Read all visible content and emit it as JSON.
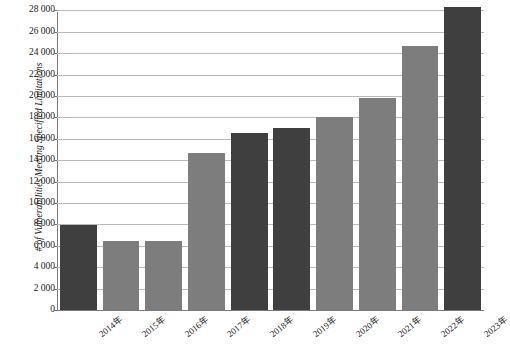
{
  "chart_data": {
    "type": "bar",
    "title": "",
    "subtitle": "",
    "xlabel": "",
    "ylabel": "# of Vulnerabilities Meeting Specified Limitations",
    "categories": [
      "2014年",
      "2015年",
      "2016年",
      "2017年",
      "2018年",
      "2019年",
      "2020年",
      "2021年",
      "2022年",
      "2023年"
    ],
    "values": [
      7900,
      6450,
      6450,
      14700,
      16500,
      17000,
      18000,
      19800,
      24700,
      28300
    ],
    "series": [
      {
        "name": "# of Vulnerabilities Meeting Specified Limitations",
        "values": [
          7900,
          6450,
          6450,
          14700,
          16500,
          17000,
          18000,
          19800,
          24700,
          28300
        ]
      }
    ],
    "bar_colors": [
      "#3f3f3f",
      "#7d7d7d",
      "#7d7d7d",
      "#7d7d7d",
      "#3f3f3f",
      "#3f3f3f",
      "#7d7d7d",
      "#7d7d7d",
      "#7d7d7d",
      "#3f3f3f"
    ],
    "ylim": [
      0,
      29000
    ],
    "ytick_values": [
      0,
      2000,
      4000,
      6000,
      8000,
      10000,
      12000,
      14000,
      16000,
      18000,
      20000,
      22000,
      24000,
      26000,
      28000
    ],
    "ytick_labels": [
      "0",
      "2 000",
      "4 000",
      "6 000",
      "8 000",
      "10 000",
      "12 000",
      "14 000",
      "16 000",
      "18 000",
      "20 000",
      "22 000",
      "24 000",
      "26 000",
      "28 000"
    ],
    "grid": true,
    "grid_axis": "y",
    "legend": false,
    "legend_position": "none",
    "background_color": "#ffffff",
    "gridline_color": "#b9b9b9",
    "axis_color": "#7a7a7a",
    "color_dark": "#3f3f3f",
    "color_light": "#7d7d7d"
  }
}
